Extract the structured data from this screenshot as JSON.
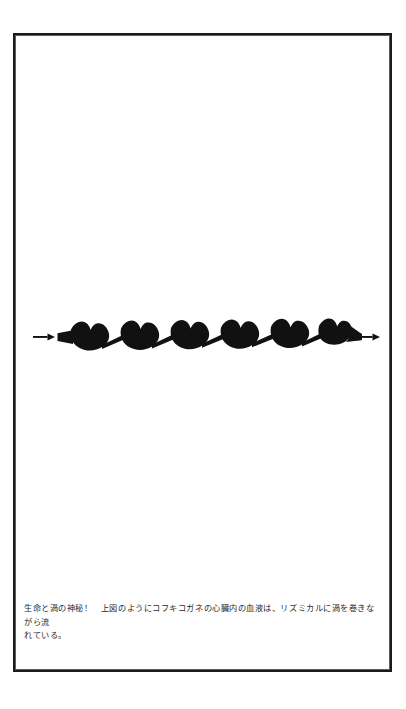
{
  "page": {
    "background_color": "#ffffff",
    "border_color": "#1a1a1a",
    "ink_color": "#111111"
  },
  "figure": {
    "name": "insect-heart-blood-vortex-diagram",
    "chamber_count": 6,
    "flow_arrow_left": "→",
    "flow_arrow_right": "→",
    "silhouette_color": "#111111"
  },
  "caption": {
    "line1": "生命と渦の神秘！　上図のようにコフキコガネの心臓内の血液は、リズミカルに渦を巻きながら流",
    "line2": "れている。",
    "full_text": "生命と渦の神秘！　上図のようにコフキコガネの心臓内の血液は、リズミカルに渦を巻きながら流れている。",
    "text_color": "#2b2b2b"
  }
}
